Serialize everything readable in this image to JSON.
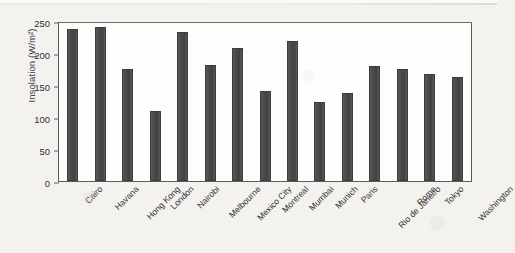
{
  "chart_data": {
    "type": "bar",
    "title": "",
    "xlabel": "",
    "ylabel": "Insolation (W/m²)",
    "ylim": [
      0,
      250
    ],
    "yticks": [
      0,
      50,
      100,
      150,
      200,
      250
    ],
    "grid": false,
    "legend": null,
    "bar_color": "#4a4a4a",
    "categories": [
      "Cairo",
      "Havana",
      "Hong Kong",
      "London",
      "Nairobi",
      "Melbourne",
      "Mexico City",
      "Montreal",
      "Mumbai",
      "Munich",
      "Paris",
      "Rio de Janeiro",
      "Rome",
      "Tokyo",
      "Washington"
    ],
    "values": [
      237,
      240,
      175,
      109,
      233,
      181,
      208,
      140,
      219,
      124,
      138,
      180,
      175,
      167,
      163
    ]
  }
}
